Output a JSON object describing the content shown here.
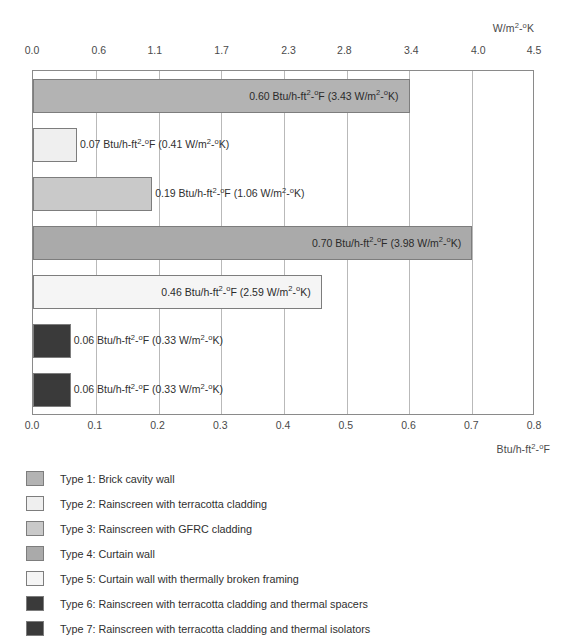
{
  "chart_data": {
    "type": "bar",
    "orientation": "horizontal",
    "title": "",
    "categories": [
      "Type 1: Brick cavity wall",
      "Type 2: Rainscreen with terracotta cladding",
      "Type 3: Rainscreen with GFRC cladding",
      "Type 4: Curtain wall",
      "Type 5: Curtain wall with thermally broken framing",
      "Type 6: Rainscreen with terracotta cladding and thermal spacers",
      "Type 7: Rainscreen with terracotta cladding and thermal isolators"
    ],
    "values": [
      0.6,
      0.07,
      0.19,
      0.7,
      0.46,
      0.06,
      0.06
    ],
    "values_metric": [
      3.43,
      0.41,
      1.06,
      3.98,
      2.59,
      0.33,
      0.33
    ],
    "data_labels": [
      "0.60 Btu/h-ft²-°F (3.43 W/m²-°K)",
      "0.07 Btu/h-ft²-°F (0.41 W/m²-°K)",
      "0.19 Btu/h-ft²-°F (1.06 W/m²-°K)",
      "0.70 Btu/h-ft²-°F (3.98 W/m²-°K)",
      "0.46 Btu/h-ft²-°F (2.59 W/m²-°K)",
      "0.06 Btu/h-ft²-°F (0.33 W/m²-°K)",
      "0.06 Btu/h-ft²-°F (0.33 W/m²-°K)"
    ],
    "label_placement": [
      "inside",
      "outside",
      "outside",
      "inside",
      "inside",
      "outside",
      "outside"
    ],
    "colors": [
      "#b3b3b3",
      "#efefef",
      "#c9c9c9",
      "#aaaaaa",
      "#f5f5f5",
      "#3a3a3a",
      "#3a3a3a"
    ],
    "xlabel": "Btu/h-ft²-°F",
    "xlabel_top": "W/m²-°K",
    "ylabel": "",
    "xlim": [
      0.0,
      0.8
    ],
    "xlim_top": [
      0.0,
      4.5
    ],
    "grid": true,
    "legend_position": "below"
  },
  "axis_top": {
    "unit": "W/m²-°K",
    "ticks": [
      "0.0",
      "0.6",
      "1.1",
      "1.7",
      "2.3",
      "2.8",
      "3.4",
      "4.0",
      "4.5"
    ],
    "tick_values": [
      0.0,
      0.6,
      1.1,
      1.7,
      2.3,
      2.8,
      3.4,
      4.0,
      4.5
    ]
  },
  "axis_bottom": {
    "unit": "Btu/h-ft²-°F",
    "ticks": [
      "0.0",
      "0.1",
      "0.2",
      "0.3",
      "0.4",
      "0.5",
      "0.6",
      "0.7",
      "0.8"
    ],
    "tick_values": [
      0.0,
      0.1,
      0.2,
      0.3,
      0.4,
      0.5,
      0.6,
      0.7,
      0.8
    ]
  },
  "legend": {
    "items": [
      {
        "label": "Type 1: Brick cavity wall",
        "color": "#b3b3b3"
      },
      {
        "label": "Type 2: Rainscreen with terracotta cladding",
        "color": "#efefef"
      },
      {
        "label": "Type 3: Rainscreen with GFRC cladding",
        "color": "#c9c9c9"
      },
      {
        "label": "Type 4: Curtain wall",
        "color": "#aaaaaa"
      },
      {
        "label": "Type 5: Curtain wall with thermally broken framing",
        "color": "#f5f5f5"
      },
      {
        "label": "Type 6: Rainscreen with terracotta cladding and thermal spacers",
        "color": "#3a3a3a"
      },
      {
        "label": "Type 7: Rainscreen with terracotta cladding and thermal isolators",
        "color": "#3a3a3a"
      }
    ]
  },
  "style": {
    "frame_color": "#8a8a8a",
    "grid_color": "#b9b9b9",
    "text_color": "#3c3c3c",
    "background": "#ffffff"
  }
}
